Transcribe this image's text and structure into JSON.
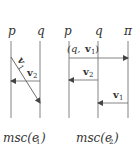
{
  "diagrams": [
    {
      "caption": "msc(e",
      "caption_sub": "1",
      "caption_close": ")",
      "processes": [
        "p",
        "q"
      ],
      "messages": [
        {
          "label": "v",
          "sub": "1",
          "from": "p",
          "to": "q",
          "style": "diagonal"
        },
        {
          "label": "v",
          "sub": "2",
          "from": "q",
          "to": "p",
          "style": "horizontal"
        }
      ]
    },
    {
      "caption": "msc(e",
      "caption_sub": "2",
      "caption_close": ")",
      "processes": [
        "p",
        "q",
        "π"
      ],
      "messages": [
        {
          "label_pre": "(q, ",
          "label": "v",
          "sub": "1",
          "label_post": ")",
          "from": "p",
          "to": "π",
          "style": "horizontal"
        },
        {
          "label": "v",
          "sub": "2",
          "from": "q",
          "to": "p",
          "style": "horizontal"
        },
        {
          "label": "v",
          "sub": "1",
          "from": "π",
          "to": "q",
          "style": "horizontal"
        }
      ]
    }
  ],
  "colors": {
    "line": "#555555",
    "text": "#333333",
    "background": "#ffffff"
  }
}
